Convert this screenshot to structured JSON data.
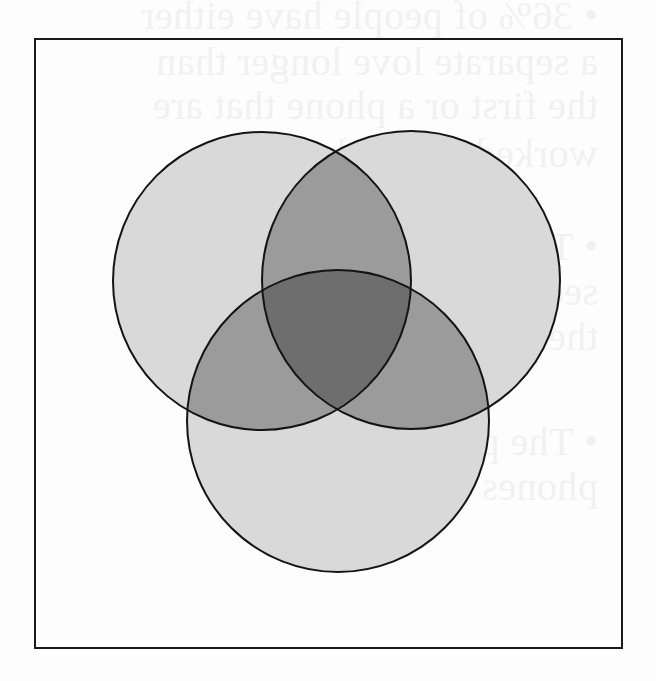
{
  "figure": {
    "type": "venn-diagram",
    "sets": 3,
    "frame": {
      "x": 35,
      "y": 39,
      "width": 587,
      "height": 609,
      "stroke": "#1a1a1a"
    },
    "circles": [
      {
        "id": "left",
        "cx": 262,
        "cy": 281,
        "r": 149
      },
      {
        "id": "right",
        "cx": 411,
        "cy": 280,
        "r": 149
      },
      {
        "id": "bottom",
        "cx": 338,
        "cy": 421,
        "r": 151
      }
    ],
    "colors": {
      "background": "#fdfdfd",
      "single_region": "#d9d9d9",
      "pair_overlap": "#9b9b9b",
      "triple_overlap": "#6e6e6e",
      "outline": "#141414"
    },
    "labels": []
  },
  "show_through_text": {
    "lines": [
      "• 36% of people have either",
      "  a separate love longer than",
      "  the first or a phone that are",
      "  worked rather than these",
      "• The probability that the",
      "  second is longer than",
      "  the first is ...",
      "• The probability that the",
      "  phones are attached"
    ]
  }
}
